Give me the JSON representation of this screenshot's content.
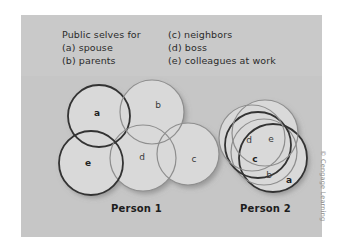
{
  "figure": {
    "legend": {
      "left_column": [
        "Public selves for",
        "(a) spouse",
        "(b) parents"
      ],
      "right_column": [
        "(c) neighbors",
        "(d) boss",
        "(e) colleagues at work"
      ]
    },
    "captions": {
      "person_1": "Person 1",
      "person_2": "Person 2"
    },
    "credit": "© Cengage Learning",
    "colors": {
      "page_background": "#ffffff",
      "panel_background": "#c6c6c6",
      "circle_fill": "#d9d9d9",
      "stroke_dark": "#333333",
      "stroke_light": "#8e8e8e",
      "label_text": "#3a3a3a",
      "caption_text": "#1d1d1d",
      "credit_text": "#8d8d8d"
    }
  },
  "chart_data": {
    "type": "diagram",
    "legend": [
      {
        "key": "a",
        "label": "spouse"
      },
      {
        "key": "b",
        "label": "parents"
      },
      {
        "key": "c",
        "label": "neighbors"
      },
      {
        "key": "d",
        "label": "boss"
      },
      {
        "key": "e",
        "label": "colleagues at work"
      }
    ],
    "groups": [
      {
        "name": "Person 1",
        "overlap": "low",
        "circles": [
          {
            "key": "a",
            "cx": 78,
            "cy": 101,
            "r": 31,
            "stroke": "dark",
            "label_x": 76,
            "label_y": 98
          },
          {
            "key": "b",
            "cx": 131,
            "cy": 97,
            "r": 32,
            "stroke": "light",
            "label_x": 137,
            "label_y": 90
          },
          {
            "key": "c",
            "cx": 167,
            "cy": 139,
            "r": 31,
            "stroke": "light",
            "label_x": 173,
            "label_y": 144
          },
          {
            "key": "d",
            "cx": 122,
            "cy": 143,
            "r": 33,
            "stroke": "light",
            "label_x": 121,
            "label_y": 142
          },
          {
            "key": "e",
            "cx": 70,
            "cy": 148,
            "r": 32,
            "stroke": "dark",
            "label_x": 67,
            "label_y": 148
          }
        ]
      },
      {
        "name": "Person 2",
        "overlap": "high",
        "circles": [
          {
            "key": "a",
            "cx": 252,
            "cy": 143,
            "r": 34,
            "stroke": "dark",
            "label_x": 268,
            "label_y": 165
          },
          {
            "key": "b",
            "cx": 243,
            "cy": 137,
            "r": 33,
            "stroke": "light",
            "label_x": 248,
            "label_y": 160
          },
          {
            "key": "c",
            "cx": 237,
            "cy": 130,
            "r": 33,
            "stroke": "dark",
            "label_x": 234,
            "label_y": 144
          },
          {
            "key": "d",
            "cx": 231,
            "cy": 123,
            "r": 33,
            "stroke": "light",
            "label_x": 228,
            "label_y": 125
          },
          {
            "key": "e",
            "cx": 244,
            "cy": 118,
            "r": 33,
            "stroke": "light",
            "label_x": 250,
            "label_y": 124
          }
        ]
      }
    ]
  }
}
